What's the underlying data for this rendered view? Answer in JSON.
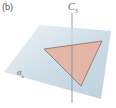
{
  "figure": {
    "panel_label": "(b)",
    "axis": {
      "symbol": "C",
      "subscript": "3"
    },
    "plane": {
      "symbol": "σ",
      "subscript": "h"
    }
  },
  "colors": {
    "plane_top": "#cfdde6",
    "plane_bottom": "#b9cfdc",
    "triangle_fill": "#e3b6a8",
    "triangle_stroke": "#8a6a66",
    "axis_line": "#8a9096",
    "text": "#555555"
  }
}
